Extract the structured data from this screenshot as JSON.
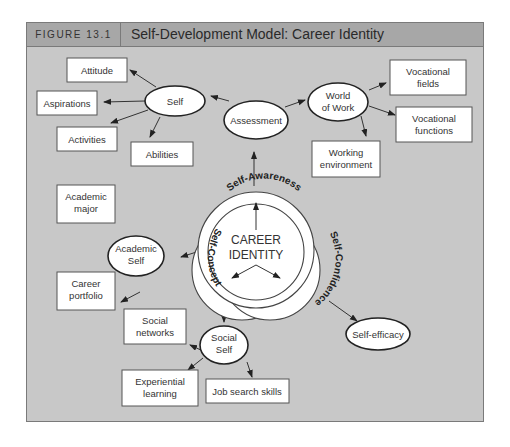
{
  "header": {
    "figure_number": "FIGURE 13.1",
    "title": "Self-Development Model: Career Identity"
  },
  "center": {
    "line1": "CAREER",
    "line2": "IDENTITY",
    "rings": {
      "top": "Self-Awareness",
      "left": "Self-Concept",
      "right": "Self-Confidence"
    }
  },
  "nodes": {
    "assessment": "Assessment",
    "self": "Self",
    "world_of_work": [
      "World",
      "of Work"
    ],
    "academic_self": [
      "Academic",
      "Self"
    ],
    "social_self": [
      "Social",
      "Self"
    ],
    "self_efficacy": "Self-efficacy"
  },
  "boxes": {
    "attitude": "Attitude",
    "aspirations": "Aspirations",
    "activities": "Activities",
    "abilities": "Abilities",
    "vocational_fields": [
      "Vocational",
      "fields"
    ],
    "vocational_functions": [
      "Vocational",
      "functions"
    ],
    "working_environment": [
      "Working",
      "environment"
    ],
    "academic_major": [
      "Academic",
      "major"
    ],
    "career_portfolio": [
      "Career",
      "portfolio"
    ],
    "social_networks": [
      "Social",
      "networks"
    ],
    "experiential_learning": [
      "Experiential",
      "learning"
    ],
    "job_search_skills": "Job search skills"
  },
  "colors": {
    "panel_bg": "#c8c8c8",
    "header_bg": "#a7a7a7",
    "border": "#7a7a7a"
  }
}
